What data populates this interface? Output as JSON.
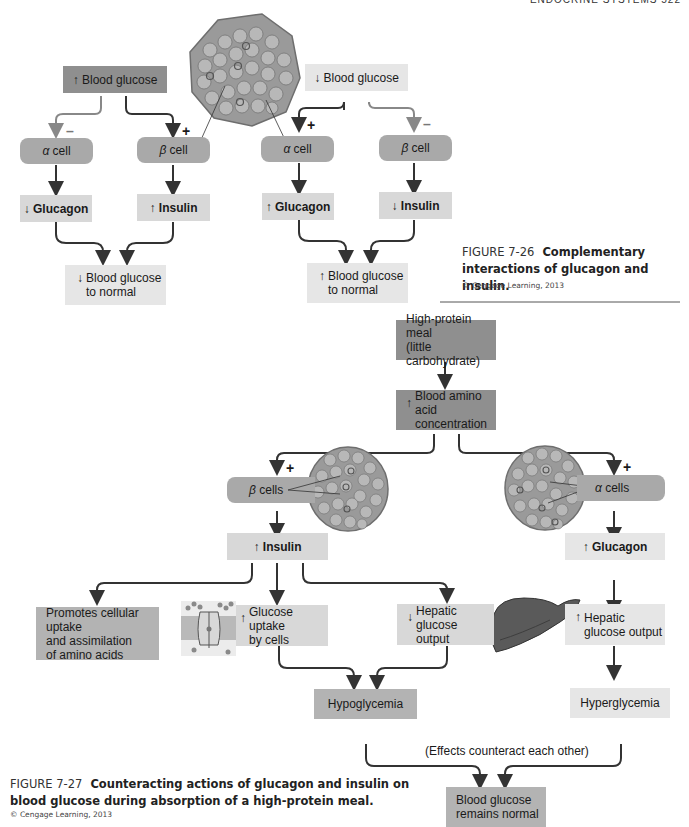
{
  "header": {
    "running_head": "ENDOCRINE SYSTEMS   522"
  },
  "figure_7_26": {
    "left": {
      "trigger": {
        "arrow": "↑",
        "label": "Blood glucose"
      },
      "alpha_cell": {
        "greek": "α",
        "label": "cell",
        "sign": "–"
      },
      "beta_cell": {
        "greek": "β",
        "label": "cell",
        "sign": "+"
      },
      "glucagon": {
        "arrow": "↓",
        "label": "Glucagon"
      },
      "insulin": {
        "arrow": "↑",
        "label": "Insulin"
      },
      "result": {
        "arrow": "↓",
        "line1": "Blood glucose",
        "line2": "to normal"
      }
    },
    "right": {
      "trigger": {
        "arrow": "↓",
        "label": "Blood glucose"
      },
      "alpha_cell": {
        "greek": "α",
        "label": "cell",
        "sign": "+"
      },
      "beta_cell": {
        "greek": "β",
        "label": "cell",
        "sign": "–"
      },
      "glucagon": {
        "arrow": "↑",
        "label": "Glucagon"
      },
      "insulin": {
        "arrow": "↓",
        "label": "Insulin"
      },
      "result": {
        "arrow": "↑",
        "line1": "Blood glucose",
        "line2": "to normal"
      }
    },
    "caption": {
      "number": "FIGURE 7-26",
      "title": "Complementary interactions of glucagon and insulin.",
      "credit": "© Cengage Learning, 2013"
    }
  },
  "figure_7_27": {
    "meal": {
      "line1": "High-protein meal",
      "line2": "(little carbohydrate)"
    },
    "amino": {
      "arrow": "↑",
      "line1": "Blood amino acid",
      "line2": "concentration"
    },
    "beta_cells": {
      "greek": "β",
      "label": "cells",
      "sign": "+"
    },
    "alpha_cells": {
      "greek": "α",
      "label": "cells",
      "sign": "+"
    },
    "insulin": {
      "arrow": "↑",
      "label": "Insulin"
    },
    "glucagon": {
      "arrow": "↑",
      "label": "Glucagon"
    },
    "promotes": {
      "line1": "Promotes cellular uptake",
      "line2": "and assimilation",
      "line3": "of amino acids"
    },
    "glucose_uptake": {
      "arrow": "↑",
      "line1": "Glucose uptake",
      "line2": "by cells"
    },
    "hepatic_down": {
      "arrow": "↓",
      "line1": "Hepatic",
      "line2": "glucose output"
    },
    "hepatic_up": {
      "arrow": "↑",
      "line1": "Hepatic",
      "line2": "glucose output"
    },
    "hypo": {
      "label": "Hypoglycemia"
    },
    "hyper": {
      "label": "Hyperglycemia"
    },
    "counteract_note": "(Effects counteract each other)",
    "final": {
      "line1": "Blood glucose",
      "line2": "remains normal"
    },
    "caption": {
      "number": "FIGURE 7-27",
      "title": "Counteracting actions of glucagon and insulin on blood glucose during absorption of a high-protein meal.",
      "credit": "© Cengage Learning, 2013"
    }
  },
  "icons": {
    "islet": "pancreatic-islet-illustration",
    "liver": "liver-illustration",
    "transporter": "membrane-glucose-transporter-illustration"
  }
}
